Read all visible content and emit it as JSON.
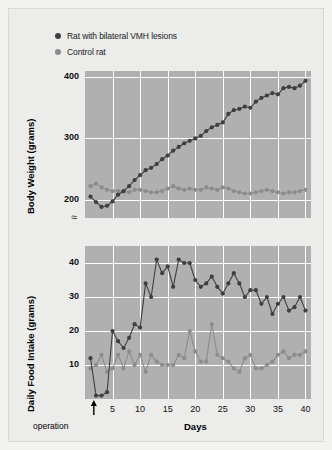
{
  "legend": {
    "items": [
      {
        "label": "Rat with bilateral VMH lesions",
        "color": "#3f3f3f",
        "marker": "legend-dot-lesion"
      },
      {
        "label": "Control rat",
        "color": "#8c8c8c",
        "marker": "legend-dot-control"
      }
    ]
  },
  "annotations": {
    "operation_label": "operation",
    "axis_break_symbol": "≈"
  },
  "colors": {
    "plot_background": "#b0b0b0",
    "gridline": "#ffffff",
    "lesion_series": "#3f3f3f",
    "control_series": "#8c8c8c",
    "card_background": "#ececeb",
    "page_background": "#f2f2f0"
  },
  "chart_data": [
    {
      "type": "line",
      "title": "",
      "panel": "top",
      "xlabel": "",
      "ylabel": "Body Weight (grams)",
      "xlim": [
        0,
        41
      ],
      "ylim": [
        170,
        410
      ],
      "yticks": [
        200,
        300,
        400
      ],
      "ytick_labels": [
        "200",
        "300",
        "400"
      ],
      "xticks": [
        5,
        10,
        15,
        20,
        25,
        30,
        35,
        40
      ],
      "xtick_labels": [
        "5",
        "10",
        "15",
        "20",
        "25",
        "30",
        "35",
        "40"
      ],
      "grid": true,
      "axis_break": true,
      "legend_position": "above-plot",
      "x": [
        1,
        2,
        3,
        4,
        5,
        6,
        7,
        8,
        9,
        10,
        11,
        12,
        13,
        14,
        15,
        16,
        17,
        18,
        19,
        20,
        21,
        22,
        23,
        24,
        25,
        26,
        27,
        28,
        29,
        30,
        31,
        32,
        33,
        34,
        35,
        36,
        37,
        38,
        39,
        40
      ],
      "series": [
        {
          "name": "Rat with bilateral VMH lesions",
          "color": "#3f3f3f",
          "values": [
            205,
            196,
            188,
            190,
            197,
            208,
            214,
            222,
            232,
            240,
            248,
            252,
            258,
            266,
            272,
            280,
            286,
            292,
            296,
            300,
            304,
            312,
            318,
            322,
            326,
            340,
            346,
            348,
            352,
            350,
            360,
            366,
            370,
            374,
            372,
            382,
            384,
            382,
            386,
            394
          ]
        },
        {
          "name": "Control rat",
          "color": "#8c8c8c",
          "values": [
            222,
            226,
            220,
            216,
            214,
            214,
            213,
            212,
            216,
            216,
            214,
            212,
            212,
            214,
            218,
            222,
            218,
            216,
            218,
            216,
            216,
            220,
            218,
            216,
            220,
            218,
            214,
            212,
            210,
            210,
            212,
            214,
            216,
            214,
            212,
            210,
            212,
            212,
            214,
            216
          ]
        }
      ]
    },
    {
      "type": "line",
      "title": "",
      "panel": "bottom",
      "xlabel": "Days",
      "ylabel": "Daily Food Intake (grams)",
      "xlim": [
        0,
        41
      ],
      "ylim": [
        0,
        45
      ],
      "yticks": [
        10,
        20,
        30,
        40
      ],
      "ytick_labels": [
        "10",
        "20",
        "30",
        "40"
      ],
      "xticks": [
        5,
        10,
        15,
        20,
        25,
        30,
        35,
        40
      ],
      "xtick_labels": [
        "5",
        "10",
        "15",
        "20",
        "25",
        "30",
        "35",
        "40"
      ],
      "grid": true,
      "x": [
        1,
        2,
        3,
        4,
        5,
        6,
        7,
        8,
        9,
        10,
        11,
        12,
        13,
        14,
        15,
        16,
        17,
        18,
        19,
        20,
        21,
        22,
        23,
        24,
        25,
        26,
        27,
        28,
        29,
        30,
        31,
        32,
        33,
        34,
        35,
        36,
        37,
        38,
        39,
        40
      ],
      "series": [
        {
          "name": "Rat with bilateral VMH lesions",
          "color": "#3f3f3f",
          "values": [
            12,
            1,
            1,
            2,
            20,
            17,
            15,
            18,
            22,
            21,
            34,
            30,
            41,
            37,
            39,
            33,
            41,
            40,
            40,
            35,
            33,
            34,
            36,
            33,
            31,
            34,
            37,
            34,
            30,
            32,
            32,
            28,
            30,
            25,
            28,
            30,
            26,
            27,
            30,
            26
          ]
        },
        {
          "name": "Control rat",
          "color": "#8c8c8c",
          "values": [
            9,
            10,
            13,
            8,
            9,
            13,
            9,
            14,
            10,
            13,
            8,
            13,
            11,
            10,
            10,
            10,
            13,
            12,
            20,
            14,
            11,
            11,
            22,
            13,
            12,
            11,
            9,
            8,
            12,
            13,
            9,
            9,
            10,
            11,
            13,
            14,
            12,
            13,
            13,
            14
          ]
        }
      ]
    }
  ]
}
